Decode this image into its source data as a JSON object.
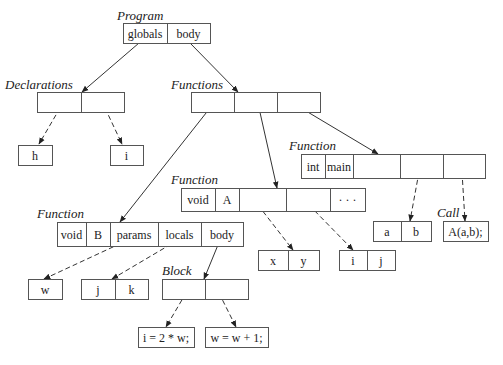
{
  "diagram": {
    "nodes": [
      {
        "id": "program",
        "label": "Program",
        "cells": [
          "globals",
          "body"
        ]
      },
      {
        "id": "declarations",
        "label": "Declarations",
        "cells": [
          "",
          ""
        ]
      },
      {
        "id": "decl-h",
        "label": "",
        "cells": [
          "h"
        ]
      },
      {
        "id": "decl-i",
        "label": "",
        "cells": [
          "i"
        ]
      },
      {
        "id": "functions",
        "label": "Functions",
        "cells": [
          "",
          "",
          ""
        ]
      },
      {
        "id": "function-main",
        "label": "Function",
        "cells": [
          "int",
          "main",
          "",
          "",
          ""
        ]
      },
      {
        "id": "function-a",
        "label": "Function",
        "cells": [
          "void",
          "A",
          "",
          "",
          "· · ·"
        ]
      },
      {
        "id": "function-b",
        "label": "Function",
        "cells": [
          "void",
          "B",
          "params",
          "locals",
          "body"
        ]
      },
      {
        "id": "main-locals",
        "label": "",
        "cells": [
          "a",
          "b"
        ]
      },
      {
        "id": "call",
        "label": "Call",
        "cells": [
          "A(a,b);"
        ]
      },
      {
        "id": "a-params",
        "label": "",
        "cells": [
          "x",
          "y"
        ]
      },
      {
        "id": "a-locals",
        "label": "",
        "cells": [
          "i",
          "j"
        ]
      },
      {
        "id": "b-params",
        "label": "",
        "cells": [
          "w"
        ]
      },
      {
        "id": "b-locals",
        "label": "",
        "cells": [
          "j",
          "k"
        ]
      },
      {
        "id": "block",
        "label": "Block",
        "cells": [
          "",
          ""
        ]
      },
      {
        "id": "stmt-1",
        "label": "",
        "cells": [
          "i = 2 * w;"
        ]
      },
      {
        "id": "stmt-2",
        "label": "",
        "cells": [
          "w = w + 1;"
        ]
      }
    ],
    "edges": [
      {
        "from": "program.globals",
        "to": "declarations",
        "style": "solid"
      },
      {
        "from": "program.body",
        "to": "functions",
        "style": "solid"
      },
      {
        "from": "declarations.0",
        "to": "decl-h",
        "style": "dashed"
      },
      {
        "from": "declarations.1",
        "to": "decl-i",
        "style": "dashed"
      },
      {
        "from": "functions.0",
        "to": "function-b",
        "style": "solid"
      },
      {
        "from": "functions.1",
        "to": "function-a",
        "style": "solid"
      },
      {
        "from": "functions.2",
        "to": "function-main",
        "style": "solid"
      },
      {
        "from": "function-main.3",
        "to": "main-locals",
        "style": "dashed"
      },
      {
        "from": "function-main.4",
        "to": "call",
        "style": "dashed"
      },
      {
        "from": "function-a.2",
        "to": "a-params",
        "style": "dashed"
      },
      {
        "from": "function-a.3",
        "to": "a-locals",
        "style": "dashed"
      },
      {
        "from": "function-b.params",
        "to": "b-params",
        "style": "dashed"
      },
      {
        "from": "function-b.locals",
        "to": "b-locals",
        "style": "dashed"
      },
      {
        "from": "function-b.body",
        "to": "block",
        "style": "solid"
      },
      {
        "from": "block.0",
        "to": "stmt-1",
        "style": "dashed"
      },
      {
        "from": "block.1",
        "to": "stmt-2",
        "style": "dashed"
      }
    ]
  }
}
